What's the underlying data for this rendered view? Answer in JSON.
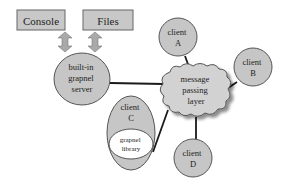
{
  "diagram": {
    "boxes": [
      {
        "id": "console",
        "label": "Console"
      },
      {
        "id": "files",
        "label": "Files"
      }
    ],
    "server": {
      "lines": [
        "built-in",
        "grapnel",
        "server"
      ]
    },
    "hub": {
      "lines": [
        "message",
        "passing",
        "layer"
      ]
    },
    "clients": {
      "a": {
        "lines": [
          "client",
          "A"
        ]
      },
      "b": {
        "lines": [
          "client",
          "B"
        ]
      },
      "c": {
        "lines": [
          "client",
          "C"
        ],
        "library": [
          "grapnel",
          "library"
        ]
      },
      "d": {
        "lines": [
          "client",
          "D"
        ]
      }
    },
    "colors": {
      "box_fill": "#c8c8c8",
      "node_fill": "#c6c6c6",
      "cloud_fill": "#d2d2d2",
      "arrow_fill": "#a9a9a9",
      "library_fill": "#ffffff",
      "stroke": "#555555"
    }
  }
}
